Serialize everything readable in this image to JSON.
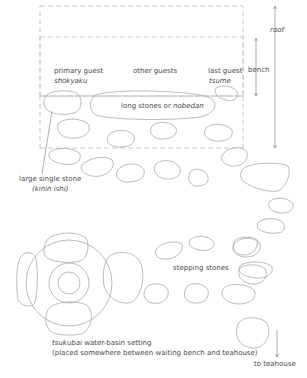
{
  "diagram": {
    "colors": {
      "stroke": "#a8a8a8",
      "dashed": "#bdbdbd",
      "text": "#4a4a4a",
      "background": "#ffffff"
    },
    "labels": {
      "roof": "roof",
      "bench": "bench",
      "primary_guest": "primary guest",
      "primary_guest_jp": "shokyaku",
      "other_guests": "other guests",
      "last_guest": "last guest",
      "last_guest_jp": "tsume",
      "long_stones_prefix": "long stones or ",
      "long_stones_jp": "nobedan",
      "large_stone": "large single stone",
      "large_stone_jp": "(kinin ishi)",
      "stepping_stones": "stepping stones",
      "tsukubai_jp": "tsukubai",
      "tsukubai_rest": " water-basin setting",
      "tsukubai_note": "(placed somewhere between waiting bench and teahouse)",
      "to_teahouse": "to teahouse"
    }
  }
}
